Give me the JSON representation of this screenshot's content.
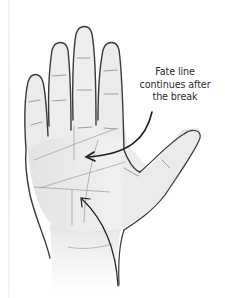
{
  "diagram": {
    "annotation": {
      "lines": [
        "Fate line",
        "continues after",
        "the break"
      ]
    },
    "arrows": [
      {
        "name": "caption-arrow",
        "points_to": "fate-line-upper-segment"
      },
      {
        "name": "lower-arrow",
        "points_to": "fate-line-break"
      }
    ],
    "colors": {
      "outline": "#3a3a3a",
      "skin": "#ececec",
      "shadow": "#d6d6d6",
      "crease": "#8a8a8a",
      "text": "#2a2a2a"
    }
  }
}
